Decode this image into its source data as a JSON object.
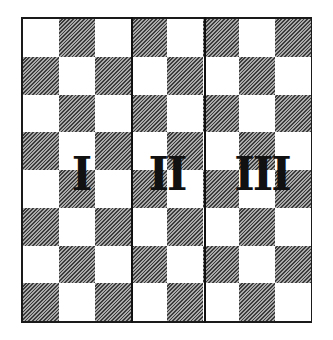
{
  "diagram": {
    "type": "checkerboard-partition",
    "rows": 8,
    "columns": 8,
    "first_square": "light",
    "colors": {
      "light": "#ffffff",
      "dark_hatch": "#3c3c3c",
      "border": "#1a1a1a",
      "numeral": "#111111"
    },
    "regions": [
      {
        "label": "I",
        "columns": [
          1,
          3
        ]
      },
      {
        "label": "II",
        "columns": [
          4,
          5
        ]
      },
      {
        "label": "III",
        "columns": [
          6,
          8
        ]
      }
    ],
    "divider_after_columns": [
      3,
      5
    ]
  }
}
